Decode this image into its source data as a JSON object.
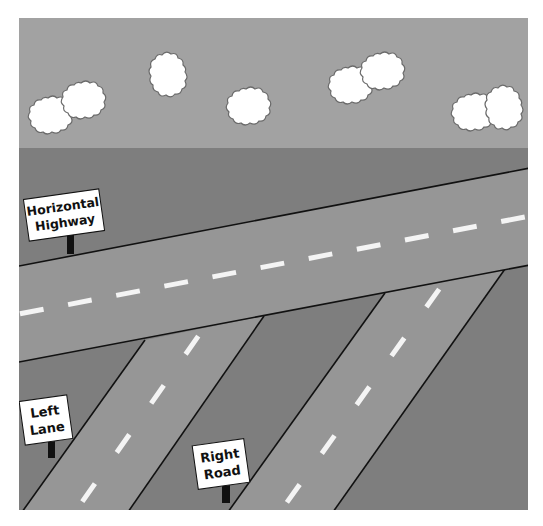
{
  "scene": {
    "title": "Road intersection illustration",
    "colors": {
      "background": "#ffffff",
      "sky": "#a2a2a2",
      "ground": "#7e7e7e",
      "road": "#969696",
      "road_edge": "#111111",
      "lane_marking": "#f4f4f4",
      "cloud_fill": "#ffffff",
      "cloud_outline": "#6a6a6a",
      "sign_fill": "#ffffff",
      "sign_post": "#111111"
    },
    "clouds_count": 8
  },
  "signs": {
    "horizontal_highway": {
      "line1": "Horizontal",
      "line2": "Highway"
    },
    "left_lane": {
      "line1": "Left",
      "line2": "Lane"
    },
    "right_road": {
      "line1": "Right",
      "line2": "Road"
    }
  },
  "roads": [
    {
      "name": "Horizontal Highway",
      "orientation": "diagonal rising left-to-right"
    },
    {
      "name": "Left Lane",
      "orientation": "diagonal branching down-left from highway"
    },
    {
      "name": "Right Road",
      "orientation": "diagonal branching down-left from highway"
    }
  ]
}
